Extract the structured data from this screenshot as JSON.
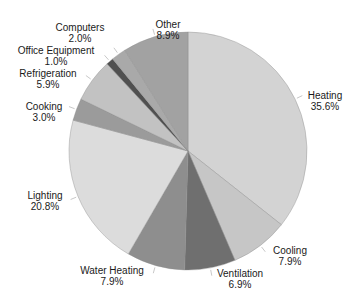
{
  "chart_data": {
    "type": "pie",
    "title": "",
    "start_angle_deg": 0,
    "direction": "clockwise",
    "center": [
      188,
      151
    ],
    "radius": 119,
    "slices": [
      {
        "label": "Heating",
        "value": 35.6,
        "display": "35.6%",
        "color": "#d3d3d3",
        "label_pos": [
          325,
          90
        ]
      },
      {
        "label": "Cooling",
        "value": 7.9,
        "display": "7.9%",
        "color": "#c6c6c6",
        "label_pos": [
          290,
          245
        ]
      },
      {
        "label": "Ventilation",
        "value": 6.9,
        "display": "6.9%",
        "color": "#6f6f6f",
        "label_pos": [
          240,
          268
        ]
      },
      {
        "label": "Water Heating",
        "value": 7.9,
        "display": "7.9%",
        "color": "#8e8e8e",
        "label_pos": [
          112,
          265
        ]
      },
      {
        "label": "Lighting",
        "value": 20.8,
        "display": "20.8%",
        "color": "#dcdcdc",
        "label_pos": [
          45,
          190
        ]
      },
      {
        "label": "Cooking",
        "value": 3.0,
        "display": "3.0%",
        "color": "#9b9b9b",
        "label_pos": [
          44,
          101
        ]
      },
      {
        "label": "Refrigeration",
        "value": 5.9,
        "display": "5.9%",
        "color": "#c2c2c2",
        "label_pos": [
          48,
          68
        ]
      },
      {
        "label": "Office Equipment",
        "value": 1.0,
        "display": "1.0%",
        "color": "#505050",
        "label_pos": [
          56,
          45
        ]
      },
      {
        "label": "Computers",
        "value": 2.0,
        "display": "2.0%",
        "color": "#a9a9a9",
        "label_pos": [
          80,
          22
        ]
      },
      {
        "label": "Other",
        "value": 8.9,
        "display": "8.9%",
        "color": "#a2a2a2",
        "label_pos": [
          168,
          19
        ]
      }
    ]
  }
}
